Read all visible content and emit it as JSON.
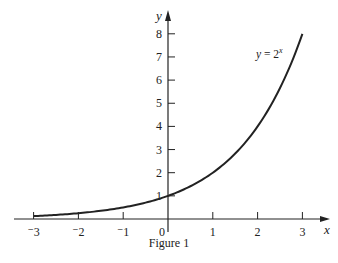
{
  "caption": "Figure 1",
  "chart_data": {
    "type": "line",
    "title": "",
    "caption": "Figure 1",
    "xlabel": "x",
    "ylabel": "y",
    "xlim": [
      -3,
      3
    ],
    "ylim": [
      0,
      8
    ],
    "x_ticks": [
      -3,
      -2,
      -1,
      0,
      1,
      2,
      3
    ],
    "x_tick_labels": [
      "⁻3",
      "⁻2",
      "⁻1",
      "0",
      "1",
      "2",
      "3"
    ],
    "y_ticks": [
      1,
      2,
      3,
      4,
      5,
      6,
      7,
      8
    ],
    "y_tick_labels": [
      "1",
      "2",
      "3",
      "4",
      "5",
      "6",
      "7",
      "8"
    ],
    "grid": false,
    "legend": null,
    "annotations": [
      {
        "text": "y = 2^x",
        "x": 2.2,
        "y": 7.1
      }
    ],
    "series": [
      {
        "name": "y = 2^x",
        "function": "2^x",
        "x": [
          -3,
          -2,
          -1,
          0,
          1,
          2,
          3
        ],
        "values": [
          0.125,
          0.25,
          0.5,
          1,
          2,
          4,
          8
        ]
      }
    ]
  },
  "colors": {
    "ink": "#222222",
    "background": "#ffffff"
  }
}
